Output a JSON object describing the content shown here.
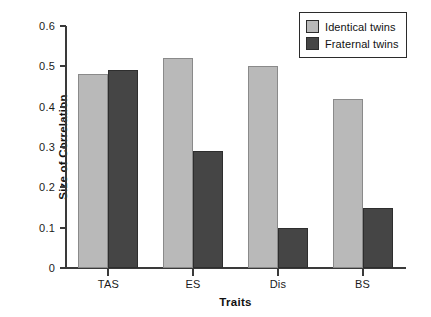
{
  "chart_data": {
    "type": "bar",
    "title": "",
    "subtitle": "",
    "xlabel": "Traits",
    "ylabel": "Size of Correlation",
    "categories": [
      "TAS",
      "ES",
      "Dis",
      "BS"
    ],
    "series": [
      {
        "name": "Identical twins",
        "color": "#b9b9b9",
        "values": [
          0.48,
          0.52,
          0.5,
          0.42
        ]
      },
      {
        "name": "Fraternal twins",
        "color": "#454545",
        "values": [
          0.49,
          0.29,
          0.1,
          0.15
        ]
      }
    ],
    "ylim": [
      0,
      0.6
    ],
    "ytick_labels": [
      "0",
      "0.1",
      "0.2",
      "0.3",
      "0.4",
      "0.5",
      "0.6"
    ],
    "ytick_values": [
      0,
      0.1,
      0.2,
      0.3,
      0.4,
      0.5,
      0.6
    ],
    "grid": false,
    "legend_position": "top-right",
    "annotations": []
  },
  "legend": {
    "entries": [
      {
        "label": "Identical twins",
        "swatch": "identical"
      },
      {
        "label": "Fraternal twins",
        "swatch": "fraternal"
      }
    ]
  }
}
